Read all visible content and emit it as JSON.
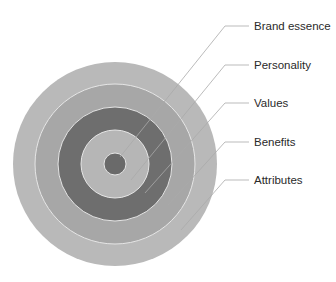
{
  "diagram": {
    "type": "concentric-rings",
    "center": [
      115,
      164
    ],
    "rings": [
      {
        "name": "Attributes",
        "radius": 102,
        "color": "#b9b9b9"
      },
      {
        "name": "Benefits",
        "radius": 80,
        "color": "#a7a7a7"
      },
      {
        "name": "Values",
        "radius": 57,
        "color": "#6e6e6e"
      },
      {
        "name": "Personality",
        "radius": 34,
        "color": "#b6b6b6"
      },
      {
        "name": "Brand essence",
        "radius": 11,
        "color": "#6a6a6a"
      }
    ],
    "separator_color": "#e6e6e6",
    "leader_color": "#aaaaaa",
    "labels": [
      {
        "text": "Brand essence",
        "y": 26,
        "end": [
          120,
          157
        ]
      },
      {
        "text": "Personality",
        "y": 65,
        "end": [
          131,
          180
        ]
      },
      {
        "text": "Values",
        "y": 103,
        "end": [
          145,
          193
        ]
      },
      {
        "text": "Benefits",
        "y": 142,
        "end": [
          168,
          205
        ]
      },
      {
        "text": "Attributes",
        "y": 180,
        "end": [
          181,
          230
        ]
      }
    ],
    "bend_x": 225,
    "line_end_x": 249,
    "label_x": 254
  }
}
